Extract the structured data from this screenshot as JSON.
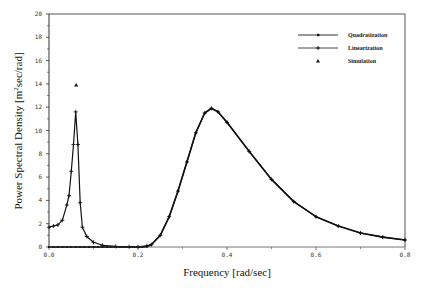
{
  "chart_data": {
    "type": "line",
    "title": "",
    "xlabel": "Frequency [rad/sec]",
    "ylabel": "Power Spectral Density [m2sec/rad]",
    "ylabel_parts": {
      "main": "Power Spectral Density [m",
      "sup": "2",
      "tail": "sec/rad]"
    },
    "xlim": [
      0.0,
      0.8
    ],
    "ylim": [
      0,
      20
    ],
    "x_ticks": [
      0.0,
      0.2,
      0.4,
      0.6,
      0.8
    ],
    "x_tick_labels": [
      "0.0",
      "0.2",
      "0.4",
      "0.6",
      "0.8"
    ],
    "y_ticks": [
      0,
      2,
      4,
      6,
      8,
      10,
      12,
      14,
      16,
      18,
      20
    ],
    "y_tick_labels": [
      "0",
      "2",
      "4",
      "6",
      "8",
      "10",
      "12",
      "14",
      "16",
      "18",
      "20"
    ],
    "grid": false,
    "legend_position": "upper right",
    "series": [
      {
        "name": "Quadratization",
        "marker": "square-dot",
        "x": [
          0.0,
          0.01,
          0.02,
          0.03,
          0.04,
          0.05,
          0.06,
          0.07,
          0.08,
          0.09,
          0.1,
          0.11,
          0.12,
          0.13,
          0.14,
          0.15,
          0.16,
          0.17,
          0.18,
          0.19,
          0.2,
          0.21,
          0.22,
          0.23,
          0.25,
          0.27,
          0.29,
          0.31,
          0.33,
          0.35,
          0.365,
          0.38,
          0.4,
          0.45,
          0.5,
          0.55,
          0.6,
          0.65,
          0.7,
          0.75,
          0.8
        ],
        "values": [
          0,
          0,
          0,
          0,
          0,
          0,
          0,
          0,
          0,
          0,
          0,
          0,
          0,
          0,
          0,
          0,
          0,
          0,
          0,
          0,
          0,
          0,
          0.05,
          0.2,
          1.0,
          2.6,
          4.8,
          7.3,
          9.8,
          11.5,
          11.9,
          11.6,
          10.7,
          8.2,
          5.8,
          3.9,
          2.6,
          1.8,
          1.2,
          0.85,
          0.6
        ]
      },
      {
        "name": "Linearization",
        "marker": "plus",
        "x": [
          0.0,
          0.01,
          0.02,
          0.03,
          0.04,
          0.045,
          0.05,
          0.055,
          0.06,
          0.065,
          0.07,
          0.075,
          0.085,
          0.1,
          0.12,
          0.15,
          0.18,
          0.2,
          0.22,
          0.23,
          0.25,
          0.27,
          0.29,
          0.31,
          0.33,
          0.35,
          0.365,
          0.38,
          0.4,
          0.45,
          0.5,
          0.55,
          0.6,
          0.65,
          0.7,
          0.75,
          0.8
        ],
        "values": [
          1.7,
          1.8,
          1.9,
          2.3,
          3.6,
          4.4,
          6.5,
          8.8,
          11.6,
          8.8,
          3.8,
          1.7,
          0.9,
          0.4,
          0.15,
          0.05,
          0.02,
          0.02,
          0.1,
          0.2,
          1.0,
          2.6,
          4.8,
          7.3,
          9.8,
          11.5,
          11.9,
          11.6,
          10.7,
          8.2,
          5.8,
          3.9,
          2.6,
          1.8,
          1.2,
          0.85,
          0.6
        ]
      },
      {
        "name": "Simulation",
        "marker": "triangle",
        "x": [
          0.061
        ],
        "values": [
          13.9
        ]
      }
    ]
  },
  "legend": {
    "items": [
      {
        "label": "Quadratization"
      },
      {
        "label": "Linearization"
      },
      {
        "label": "Simulation"
      }
    ]
  }
}
